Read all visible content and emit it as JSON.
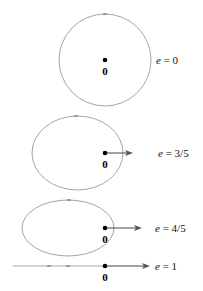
{
  "figure": {
    "colors": {
      "orbit": "#9a9a9a",
      "vector": "#444444",
      "dot": "#000000"
    },
    "panels": [
      {
        "id": "circle",
        "e_symbol": "e",
        "e_value": "0",
        "equals": " = ",
        "origin_label": "0",
        "shape": "circle",
        "has_vector": false
      },
      {
        "id": "ellipse-3-5",
        "e_symbol": "e",
        "e_value": "3/5",
        "equals": " = ",
        "origin_label": "0",
        "shape": "ellipse",
        "has_vector": true
      },
      {
        "id": "ellipse-4-5",
        "e_symbol": "e",
        "e_value": "4/5",
        "equals": " = ",
        "origin_label": "0",
        "shape": "ellipse",
        "has_vector": true
      },
      {
        "id": "line",
        "e_symbol": "e",
        "e_value": "1",
        "equals": " = ",
        "origin_label": "0",
        "shape": "line",
        "has_vector": true
      }
    ]
  }
}
